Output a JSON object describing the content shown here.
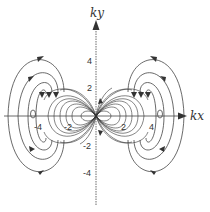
{
  "diagram": {
    "type": "field-line plot",
    "axes": {
      "x_label": "kx",
      "y_label": "ky",
      "x_ticks": [
        "-4",
        "-2",
        "2",
        "4"
      ],
      "y_ticks": [
        "4",
        "2",
        "-2",
        "-4"
      ]
    },
    "colors": {
      "line": "#444444",
      "background": "#ffffff"
    }
  }
}
